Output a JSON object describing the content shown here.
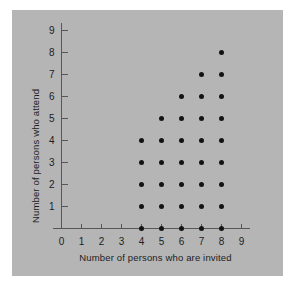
{
  "chart_data": {
    "type": "scatter",
    "title": "",
    "xlabel": "Number of persons who are invited",
    "ylabel": "Number of persons who attend",
    "xlim": [
      0,
      9
    ],
    "ylim": [
      0,
      9
    ],
    "xticks": [
      0,
      1,
      2,
      3,
      4,
      5,
      6,
      7,
      8,
      9
    ],
    "yticks": [
      1,
      2,
      3,
      4,
      5,
      6,
      7,
      8,
      9
    ],
    "xtick_labels": [
      "0",
      "1",
      "2",
      "3",
      "4",
      "5",
      "6",
      "7",
      "8",
      "9"
    ],
    "ytick_labels": [
      "1",
      "2",
      "3",
      "4",
      "5",
      "6",
      "7",
      "8",
      "9"
    ],
    "grid": false,
    "legend": null,
    "marker": "filled-circle",
    "marker_color": "#131315",
    "points": [
      {
        "x": 4,
        "y": 0
      },
      {
        "x": 4,
        "y": 1
      },
      {
        "x": 4,
        "y": 2
      },
      {
        "x": 4,
        "y": 3
      },
      {
        "x": 4,
        "y": 4
      },
      {
        "x": 5,
        "y": 0
      },
      {
        "x": 5,
        "y": 1
      },
      {
        "x": 5,
        "y": 2
      },
      {
        "x": 5,
        "y": 3
      },
      {
        "x": 5,
        "y": 4
      },
      {
        "x": 5,
        "y": 5
      },
      {
        "x": 6,
        "y": 0
      },
      {
        "x": 6,
        "y": 1
      },
      {
        "x": 6,
        "y": 2
      },
      {
        "x": 6,
        "y": 3
      },
      {
        "x": 6,
        "y": 4
      },
      {
        "x": 6,
        "y": 5
      },
      {
        "x": 6,
        "y": 6
      },
      {
        "x": 7,
        "y": 0
      },
      {
        "x": 7,
        "y": 1
      },
      {
        "x": 7,
        "y": 2
      },
      {
        "x": 7,
        "y": 3
      },
      {
        "x": 7,
        "y": 4
      },
      {
        "x": 7,
        "y": 5
      },
      {
        "x": 7,
        "y": 6
      },
      {
        "x": 7,
        "y": 7
      },
      {
        "x": 8,
        "y": 0
      },
      {
        "x": 8,
        "y": 1
      },
      {
        "x": 8,
        "y": 2
      },
      {
        "x": 8,
        "y": 3
      },
      {
        "x": 8,
        "y": 4
      },
      {
        "x": 8,
        "y": 5
      },
      {
        "x": 8,
        "y": 6
      },
      {
        "x": 8,
        "y": 7
      },
      {
        "x": 8,
        "y": 8
      }
    ]
  },
  "style": {
    "panel_color": "#b5b5b5",
    "page_color": "#ffffff",
    "axis_color": "#57575a",
    "text_color": "#1c1c1e"
  }
}
